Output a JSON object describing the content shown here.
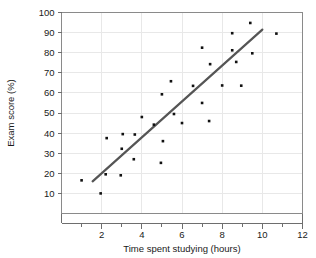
{
  "chart_data": {
    "type": "scatter",
    "title": "",
    "xlabel": "Time spent studying (hours)",
    "ylabel": "Exam score (%)",
    "xlim": [
      0,
      12
    ],
    "ylim": [
      0,
      100
    ],
    "xticks": [
      2,
      4,
      6,
      8,
      10,
      12
    ],
    "xtick_labels": [
      "2",
      "4",
      "6",
      "8",
      "10",
      "12"
    ],
    "xminor_ticks": [
      1,
      3,
      5,
      7,
      9,
      11
    ],
    "yticks": [
      10,
      20,
      30,
      40,
      50,
      60,
      70,
      80,
      90,
      100
    ],
    "ytick_labels": [
      "10",
      "20",
      "30",
      "40",
      "50",
      "60",
      "70",
      "80",
      "90",
      "100"
    ],
    "grid": true,
    "legend": "none",
    "series": [
      {
        "name": "students",
        "marker": "square",
        "color": "#111111",
        "points": [
          {
            "x": 1.0,
            "y": 16.5
          },
          {
            "x": 1.95,
            "y": 10.0
          },
          {
            "x": 2.2,
            "y": 19.5
          },
          {
            "x": 2.25,
            "y": 37.5
          },
          {
            "x": 2.95,
            "y": 19.0
          },
          {
            "x": 3.0,
            "y": 32.2
          },
          {
            "x": 3.05,
            "y": 39.5
          },
          {
            "x": 3.6,
            "y": 27.0
          },
          {
            "x": 3.65,
            "y": 39.3
          },
          {
            "x": 4.0,
            "y": 48.0
          },
          {
            "x": 4.6,
            "y": 44.2
          },
          {
            "x": 4.95,
            "y": 25.2
          },
          {
            "x": 5.0,
            "y": 59.3
          },
          {
            "x": 5.05,
            "y": 36.0
          },
          {
            "x": 5.45,
            "y": 65.8
          },
          {
            "x": 5.6,
            "y": 49.5
          },
          {
            "x": 6.0,
            "y": 45.0
          },
          {
            "x": 6.55,
            "y": 63.5
          },
          {
            "x": 7.0,
            "y": 55.0
          },
          {
            "x": 7.0,
            "y": 82.5
          },
          {
            "x": 7.35,
            "y": 46.0
          },
          {
            "x": 7.4,
            "y": 74.3
          },
          {
            "x": 8.0,
            "y": 63.7
          },
          {
            "x": 8.5,
            "y": 81.2
          },
          {
            "x": 8.5,
            "y": 89.7
          },
          {
            "x": 8.7,
            "y": 75.4
          },
          {
            "x": 8.95,
            "y": 63.6
          },
          {
            "x": 9.4,
            "y": 94.8
          },
          {
            "x": 9.5,
            "y": 79.7
          },
          {
            "x": 10.7,
            "y": 89.5
          }
        ]
      }
    ],
    "trendline": {
      "name": "line of best fit",
      "color": "#555555",
      "x_start": 1.55,
      "y_start": 16.0,
      "x_end": 10.0,
      "y_end": 91.5
    }
  }
}
